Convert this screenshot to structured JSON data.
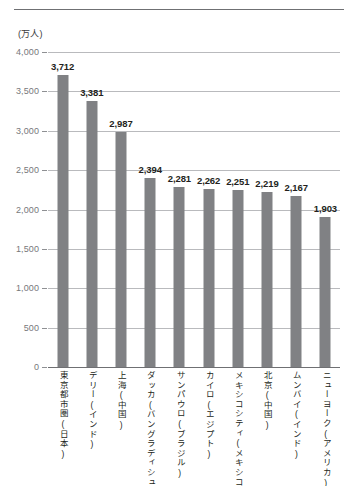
{
  "chart_data": {
    "type": "bar",
    "title": "",
    "subtitle": "",
    "unit_label": "(万人)",
    "xlabel": "",
    "ylabel": "",
    "ylim": [
      0,
      4000
    ],
    "ytick_labels": [
      "4,000",
      "3,500",
      "3,000",
      "2,500",
      "2,000",
      "1,500",
      "1,000",
      "500",
      "0"
    ],
    "ytick_values": [
      4000,
      3500,
      3000,
      2500,
      2000,
      1500,
      1000,
      500,
      0
    ],
    "grid": true,
    "legend": "none",
    "bar_color": "#808184",
    "categories": [
      "東京都市圏(日本)",
      "デリー(インド)",
      "上海(中国)",
      "ダッカ(バングラディシュ)",
      "サンパウロ(ブラジル)",
      "カイロ(エジプト)",
      "メキシコシティ(メキシコ)",
      "北京(中国)",
      "ムンバイ(インド)",
      "ニューヨーク(アメリカ)"
    ],
    "values": [
      3712,
      3381,
      2987,
      2394,
      2281,
      2262,
      2251,
      2219,
      2167,
      1903
    ],
    "value_labels": [
      "3,712",
      "3,381",
      "2,987",
      "2,394",
      "2,281",
      "2,262",
      "2,251",
      "2,219",
      "2,167",
      "1,903"
    ]
  }
}
